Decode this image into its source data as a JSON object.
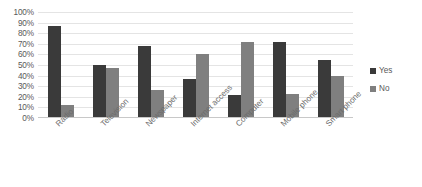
{
  "chart_data": {
    "type": "bar",
    "title": "",
    "subtitle": "",
    "xlabel": "",
    "ylabel": "",
    "ylim": [
      0,
      100
    ],
    "y_tick_labels": [
      "100%",
      "90%",
      "80%",
      "70%",
      "60%",
      "50%",
      "40%",
      "30%",
      "20%",
      "10%",
      "0%"
    ],
    "y_tick_values": [
      100,
      90,
      80,
      70,
      60,
      50,
      40,
      30,
      20,
      10,
      0
    ],
    "grid": true,
    "legend_position": "right",
    "categories": [
      "Radio",
      "Television",
      "Newspaper",
      "Internet access",
      "Computer",
      "Mobile phone",
      "Smart phone"
    ],
    "series": [
      {
        "name": "Yes",
        "color": "#3a3a3a",
        "values": [
          87,
          50,
          68,
          37,
          22,
          72,
          55
        ]
      },
      {
        "name": "No",
        "color": "#7f7f7f",
        "values": [
          12,
          47,
          26,
          60,
          72,
          23,
          40
        ]
      }
    ]
  },
  "legend": {
    "entries": [
      {
        "label": "Yes",
        "color": "#3a3a3a"
      },
      {
        "label": "No",
        "color": "#7f7f7f"
      }
    ]
  }
}
